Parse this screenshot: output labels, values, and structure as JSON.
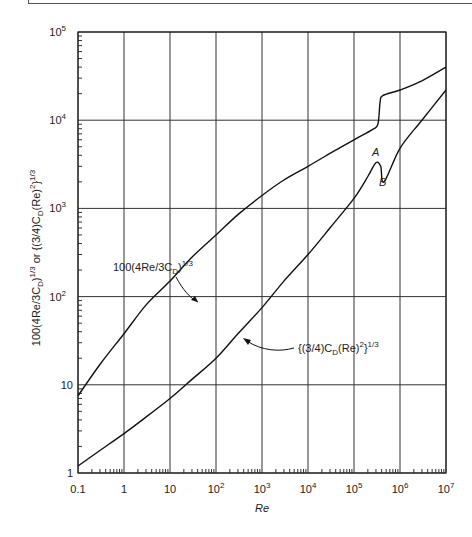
{
  "chart_data": {
    "type": "line",
    "title": "",
    "xlabel": "Re",
    "ylabel": "100(4Re/3C_D)^1/3 or {(3/4)C_D(Re)^2}^1/3",
    "xscale": "log",
    "yscale": "log",
    "xlim": [
      0.1,
      10000000
    ],
    "ylim": [
      1,
      100000
    ],
    "grid": true,
    "legend": "none (inline annotations)",
    "x_tick_labels": [
      "0.1",
      "1",
      "10",
      "10²",
      "10³",
      "10⁴",
      "10⁵",
      "10⁶",
      "10⁷"
    ],
    "y_tick_labels": [
      "1",
      "10",
      "10²",
      "10³",
      "10⁴",
      "10⁵"
    ],
    "series": [
      {
        "name": "100(4Re/3C_D)^1/3",
        "x": [
          0.1,
          0.3,
          1,
          3,
          10,
          30,
          100,
          300,
          1000,
          3000,
          10000,
          30000,
          100000,
          250000,
          330000,
          370000,
          420000,
          1000000,
          3000000,
          10000000
        ],
        "values": [
          7.5,
          17,
          38,
          80,
          150,
          280,
          500,
          850,
          1400,
          2100,
          3000,
          4200,
          6000,
          7800,
          9000,
          16000,
          19000,
          22000,
          28000,
          40000
        ]
      },
      {
        "name": "{(3/4)C_D(Re)^2}^1/3",
        "x": [
          0.1,
          0.3,
          1,
          3,
          10,
          30,
          100,
          300,
          1000,
          3000,
          10000,
          30000,
          100000,
          200000,
          300000,
          380000,
          450000,
          1000000,
          3000000,
          10000000
        ],
        "values": [
          1.2,
          1.8,
          2.8,
          4.3,
          7,
          11.5,
          20,
          38,
          75,
          150,
          300,
          600,
          1300,
          2300,
          3300,
          3000,
          2000,
          4800,
          10000,
          22000
        ]
      }
    ],
    "annotations": [
      {
        "text": "A",
        "at_x": 300000,
        "at_y": 3300,
        "note": "local maximum of lower curve"
      },
      {
        "text": "B",
        "at_x": 450000,
        "at_y": 2000,
        "note": "local minimum of lower curve"
      }
    ]
  },
  "labels": {
    "upper_curve": "100(4Re/3C",
    "upper_curve_sub": "D",
    "upper_curve_end": ")",
    "upper_curve_sup": "1/3",
    "lower_curve_a": "{(3/4)C",
    "lower_curve_sub": "D",
    "lower_curve_b": "(Re)",
    "lower_curve_sup2": "2",
    "lower_curve_c": "}",
    "lower_curve_sup": "1/3",
    "point_a": "A",
    "point_b": "B",
    "x_axis_title": "Re",
    "y_axis_title_a": "100(4Re/3C",
    "y_axis_sub": "D",
    "y_axis_title_b": ")",
    "y_axis_sup": "1/3",
    "y_axis_title_c": " or {(3/4)C",
    "y_axis_sub2": "D",
    "y_axis_title_d": "(Re)",
    "y_axis_sup2": "2",
    "y_axis_title_e": "}",
    "y_axis_sup3": "1/3"
  },
  "x_ticks": [
    {
      "base": "0.1",
      "exp": ""
    },
    {
      "base": "1",
      "exp": ""
    },
    {
      "base": "10",
      "exp": ""
    },
    {
      "base": "10",
      "exp": "2"
    },
    {
      "base": "10",
      "exp": "3"
    },
    {
      "base": "10",
      "exp": "4"
    },
    {
      "base": "10",
      "exp": "5"
    },
    {
      "base": "10",
      "exp": "6"
    },
    {
      "base": "10",
      "exp": "7"
    }
  ],
  "y_ticks": [
    {
      "base": "1",
      "exp": ""
    },
    {
      "base": "10",
      "exp": ""
    },
    {
      "base": "10",
      "exp": "2"
    },
    {
      "base": "10",
      "exp": "3"
    },
    {
      "base": "10",
      "exp": "4"
    },
    {
      "base": "10",
      "exp": "5"
    }
  ]
}
